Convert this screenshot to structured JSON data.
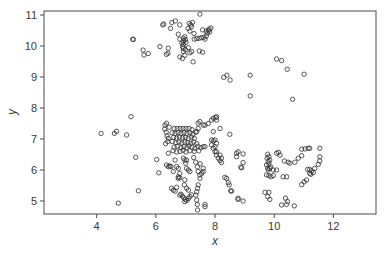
{
  "chart_data": {
    "type": "scatter",
    "title": "",
    "xlabel": "x",
    "ylabel": "y",
    "xlim": [
      2.22,
      13.44
    ],
    "ylim": [
      4.58,
      11.13
    ],
    "x_ticks": [
      4,
      6,
      8,
      10,
      12
    ],
    "y_ticks": [
      5,
      6,
      7,
      8,
      9,
      10,
      11
    ],
    "grid": false,
    "legend": null,
    "marker": "open-circle",
    "points": [
      [
        5.22,
        10.22
      ],
      [
        5.24,
        10.21
      ],
      [
        5.57,
        9.87
      ],
      [
        5.6,
        9.71
      ],
      [
        5.74,
        9.76
      ],
      [
        6.14,
        9.98
      ],
      [
        6.42,
        9.93
      ],
      [
        6.41,
        9.77
      ],
      [
        6.36,
        9.73
      ],
      [
        6.23,
        10.68
      ],
      [
        6.27,
        10.71
      ],
      [
        6.54,
        10.76
      ],
      [
        6.66,
        10.81
      ],
      [
        6.5,
        10.57
      ],
      [
        6.81,
        10.68
      ],
      [
        6.76,
        10.38
      ],
      [
        6.81,
        10.22
      ],
      [
        6.93,
        10.25
      ],
      [
        6.93,
        10.16
      ],
      [
        6.93,
        10.05
      ],
      [
        6.93,
        9.93
      ],
      [
        6.93,
        9.82
      ],
      [
        6.98,
        10.3
      ],
      [
        7.0,
        10.2
      ],
      [
        6.88,
        10.1
      ],
      [
        7.02,
        10.12
      ],
      [
        6.9,
        9.98
      ],
      [
        7.0,
        9.88
      ],
      [
        6.81,
        9.65
      ],
      [
        6.98,
        9.7
      ],
      [
        6.9,
        9.6
      ],
      [
        7.13,
        10.73
      ],
      [
        7.24,
        10.76
      ],
      [
        7.49,
        11.03
      ],
      [
        7.09,
        10.57
      ],
      [
        7.15,
        10.48
      ],
      [
        7.29,
        10.4
      ],
      [
        7.2,
        10.62
      ],
      [
        7.18,
        10.68
      ],
      [
        7.58,
        10.52
      ],
      [
        7.78,
        10.5
      ],
      [
        7.82,
        10.45
      ],
      [
        7.74,
        10.42
      ],
      [
        7.8,
        10.55
      ],
      [
        7.7,
        10.48
      ],
      [
        7.86,
        10.58
      ],
      [
        7.3,
        10.22
      ],
      [
        7.38,
        10.24
      ],
      [
        7.46,
        10.25
      ],
      [
        7.54,
        10.27
      ],
      [
        7.62,
        10.28
      ],
      [
        7.7,
        10.32
      ],
      [
        7.66,
        10.22
      ],
      [
        7.21,
        9.82
      ],
      [
        7.47,
        9.84
      ],
      [
        7.58,
        9.8
      ],
      [
        7.26,
        9.49
      ],
      [
        7.1,
        9.95
      ],
      [
        7.15,
        9.78
      ],
      [
        8.29,
        8.99
      ],
      [
        8.4,
        9.06
      ],
      [
        8.51,
        8.9
      ],
      [
        9.19,
        9.06
      ],
      [
        9.19,
        8.39
      ],
      [
        10.08,
        9.58
      ],
      [
        10.25,
        9.53
      ],
      [
        10.44,
        9.25
      ],
      [
        11.01,
        9.09
      ],
      [
        10.62,
        8.28
      ],
      [
        5.16,
        7.72
      ],
      [
        4.15,
        7.18
      ],
      [
        4.6,
        7.18
      ],
      [
        4.67,
        7.25
      ],
      [
        5.01,
        7.13
      ],
      [
        5.32,
        6.41
      ],
      [
        6.03,
        6.34
      ],
      [
        6.1,
        5.91
      ],
      [
        5.41,
        5.33
      ],
      [
        4.73,
        4.93
      ],
      [
        6.31,
        7.45
      ],
      [
        6.36,
        7.51
      ],
      [
        6.3,
        7.32
      ],
      [
        6.35,
        7.22
      ],
      [
        6.38,
        7.1
      ],
      [
        6.42,
        7.02
      ],
      [
        6.4,
        6.92
      ],
      [
        6.33,
        6.85
      ],
      [
        6.45,
        7.38
      ],
      [
        6.62,
        7.34
      ],
      [
        6.72,
        7.34
      ],
      [
        6.82,
        7.34
      ],
      [
        6.92,
        7.34
      ],
      [
        7.02,
        7.34
      ],
      [
        7.12,
        7.34
      ],
      [
        7.22,
        7.3
      ],
      [
        6.55,
        7.2
      ],
      [
        6.65,
        7.18
      ],
      [
        6.75,
        7.2
      ],
      [
        6.85,
        7.18
      ],
      [
        6.95,
        7.2
      ],
      [
        7.05,
        7.18
      ],
      [
        7.15,
        7.2
      ],
      [
        7.25,
        7.15
      ],
      [
        7.35,
        7.22
      ],
      [
        6.6,
        7.05
      ],
      [
        6.7,
        7.03
      ],
      [
        6.8,
        7.06
      ],
      [
        6.9,
        7.04
      ],
      [
        7.0,
        7.05
      ],
      [
        7.1,
        7.02
      ],
      [
        7.2,
        7.06
      ],
      [
        7.3,
        7.02
      ],
      [
        6.55,
        6.92
      ],
      [
        6.68,
        6.88
      ],
      [
        6.78,
        6.9
      ],
      [
        6.88,
        6.87
      ],
      [
        6.98,
        6.9
      ],
      [
        7.08,
        6.88
      ],
      [
        7.18,
        6.86
      ],
      [
        7.28,
        6.9
      ],
      [
        7.38,
        6.85
      ],
      [
        6.62,
        6.74
      ],
      [
        6.72,
        6.76
      ],
      [
        6.85,
        6.72
      ],
      [
        6.95,
        6.75
      ],
      [
        7.05,
        6.72
      ],
      [
        7.12,
        6.78
      ],
      [
        7.22,
        6.74
      ],
      [
        7.32,
        6.7
      ],
      [
        7.42,
        6.76
      ],
      [
        7.52,
        6.72
      ],
      [
        7.6,
        6.75
      ],
      [
        6.58,
        6.62
      ],
      [
        6.7,
        6.58
      ],
      [
        6.82,
        6.6
      ],
      [
        6.92,
        6.64
      ],
      [
        7.02,
        6.58
      ],
      [
        7.15,
        6.62
      ],
      [
        7.3,
        6.6
      ],
      [
        7.45,
        6.62
      ],
      [
        7.43,
        7.51
      ],
      [
        7.49,
        7.56
      ],
      [
        7.6,
        7.45
      ],
      [
        7.66,
        7.45
      ],
      [
        7.77,
        7.5
      ],
      [
        7.88,
        7.61
      ],
      [
        7.94,
        7.67
      ],
      [
        8.02,
        7.69
      ],
      [
        8.05,
        7.72
      ],
      [
        8.05,
        7.61
      ],
      [
        8.17,
        7.34
      ],
      [
        8.5,
        7.15
      ],
      [
        7.43,
        7.34
      ],
      [
        7.38,
        7.24
      ],
      [
        7.94,
        7.24
      ],
      [
        7.88,
        6.97
      ],
      [
        7.94,
        6.94
      ],
      [
        8.0,
        6.97
      ],
      [
        7.88,
        6.81
      ],
      [
        7.94,
        6.7
      ],
      [
        8.0,
        6.59
      ],
      [
        8.05,
        6.86
      ],
      [
        8.0,
        6.75
      ],
      [
        8.05,
        6.59
      ],
      [
        7.66,
        6.75
      ],
      [
        8.05,
        6.48
      ],
      [
        8.11,
        6.38
      ],
      [
        8.17,
        6.3
      ],
      [
        8.22,
        6.24
      ],
      [
        8.17,
        6.48
      ],
      [
        8.22,
        6.38
      ],
      [
        8.73,
        6.54
      ],
      [
        8.73,
        6.43
      ],
      [
        8.95,
        6.52
      ],
      [
        8.95,
        6.24
      ],
      [
        8.87,
        6.09
      ],
      [
        8.78,
        6.59
      ],
      [
        8.9,
        6.07
      ],
      [
        8.33,
        5.76
      ],
      [
        8.45,
        5.59
      ],
      [
        8.48,
        5.52
      ],
      [
        8.53,
        5.33
      ],
      [
        8.39,
        5.73
      ],
      [
        8.56,
        5.32
      ],
      [
        8.78,
        5.05
      ],
      [
        8.95,
        5.0
      ],
      [
        8.78,
        5.09
      ],
      [
        6.42,
        6.54
      ],
      [
        6.36,
        6.16
      ],
      [
        6.47,
        6.13
      ],
      [
        6.65,
        6.32
      ],
      [
        6.7,
        6.11
      ],
      [
        6.59,
        5.95
      ],
      [
        6.76,
        5.78
      ],
      [
        6.81,
        5.75
      ],
      [
        6.42,
        6.11
      ],
      [
        6.51,
        6.11
      ],
      [
        6.76,
        6.05
      ],
      [
        6.81,
        5.89
      ],
      [
        6.76,
        5.73
      ],
      [
        6.93,
        6.38
      ],
      [
        6.98,
        6.32
      ],
      [
        7.01,
        6.22
      ],
      [
        7.04,
        6.05
      ],
      [
        7.1,
        6.0
      ],
      [
        7.15,
        5.95
      ],
      [
        7.04,
        6.32
      ],
      [
        6.98,
        5.68
      ],
      [
        6.96,
        5.52
      ],
      [
        7.04,
        5.41
      ],
      [
        7.1,
        5.35
      ],
      [
        6.53,
        5.41
      ],
      [
        6.59,
        5.35
      ],
      [
        6.65,
        5.32
      ],
      [
        6.7,
        5.44
      ],
      [
        6.81,
        5.19
      ],
      [
        6.85,
        5.22
      ],
      [
        6.9,
        5.15
      ],
      [
        6.95,
        5.1
      ],
      [
        7.0,
        5.05
      ],
      [
        7.05,
        5.02
      ],
      [
        7.1,
        5.08
      ],
      [
        7.15,
        5.14
      ],
      [
        7.2,
        5.2
      ],
      [
        6.98,
        4.98
      ],
      [
        7.43,
        5.95
      ],
      [
        7.49,
        5.84
      ],
      [
        7.55,
        5.89
      ],
      [
        7.6,
        5.95
      ],
      [
        7.49,
        5.73
      ],
      [
        7.43,
        5.52
      ],
      [
        7.41,
        5.41
      ],
      [
        7.38,
        5.3
      ],
      [
        7.35,
        5.19
      ],
      [
        7.38,
        5.03
      ],
      [
        7.4,
        4.89
      ],
      [
        7.41,
        4.71
      ],
      [
        7.66,
        4.89
      ],
      [
        7.66,
        4.82
      ],
      [
        7.4,
        6.1
      ],
      [
        7.35,
        6.25
      ],
      [
        7.28,
        6.4
      ],
      [
        7.5,
        6.2
      ],
      [
        7.6,
        6.05
      ],
      [
        9.78,
        6.51
      ],
      [
        9.82,
        6.43
      ],
      [
        9.85,
        6.32
      ],
      [
        9.8,
        6.27
      ],
      [
        9.74,
        6.16
      ],
      [
        9.78,
        6.05
      ],
      [
        9.8,
        6.0
      ],
      [
        9.85,
        6.05
      ],
      [
        9.97,
        6.0
      ],
      [
        10.08,
        6.0
      ],
      [
        9.74,
        5.84
      ],
      [
        9.82,
        5.82
      ],
      [
        9.89,
        5.78
      ],
      [
        9.97,
        5.82
      ],
      [
        9.82,
        6.2
      ],
      [
        9.88,
        6.1
      ],
      [
        9.76,
        6.38
      ],
      [
        10.08,
        6.54
      ],
      [
        10.14,
        6.57
      ],
      [
        10.2,
        6.48
      ],
      [
        10.34,
        6.29
      ],
      [
        10.47,
        6.25
      ],
      [
        10.53,
        6.22
      ],
      [
        10.7,
        6.25
      ],
      [
        10.3,
        5.78
      ],
      [
        10.42,
        5.78
      ],
      [
        10.81,
        6.38
      ],
      [
        10.93,
        6.46
      ],
      [
        10.93,
        6.67
      ],
      [
        11.04,
        6.68
      ],
      [
        11.15,
        6.7
      ],
      [
        11.2,
        6.7
      ],
      [
        11.54,
        6.7
      ],
      [
        11.54,
        6.43
      ],
      [
        11.54,
        6.29
      ],
      [
        11.49,
        6.18
      ],
      [
        11.13,
        6.02
      ],
      [
        11.2,
        6.02
      ],
      [
        11.26,
        5.97
      ],
      [
        11.2,
        5.89
      ],
      [
        11.24,
        5.86
      ],
      [
        11.32,
        5.92
      ],
      [
        11.37,
        6.05
      ],
      [
        10.93,
        5.53
      ],
      [
        11.01,
        5.62
      ],
      [
        11.09,
        5.68
      ],
      [
        9.69,
        5.28
      ],
      [
        9.82,
        5.28
      ],
      [
        9.78,
        5.14
      ],
      [
        9.85,
        5.05
      ],
      [
        10.38,
        5.09
      ],
      [
        10.45,
        4.98
      ],
      [
        10.42,
        4.89
      ],
      [
        10.25,
        4.87
      ],
      [
        10.68,
        4.84
      ]
    ]
  },
  "layout": {
    "plot": {
      "left": 44,
      "top": 11,
      "right": 376,
      "bottom": 214
    },
    "colors": {
      "frame": "#4a4a4a",
      "marker": "#2e2e2e",
      "text": "#3a3a3a",
      "background": "#ffffff"
    }
  }
}
